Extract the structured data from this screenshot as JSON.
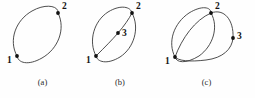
{
  "figure": {
    "background_color": "#fefefe",
    "curve_color": "#3a3a3a",
    "node_color": "#111111",
    "label_color": "#141414",
    "panels": [
      {
        "id": "a",
        "caption": "(a)",
        "description": "single closed elliptical curve with two end nodes",
        "nodes": [
          {
            "label": "1",
            "x": 17,
            "y": 56
          },
          {
            "label": "2",
            "x": 58,
            "y": 13
          }
        ]
      },
      {
        "id": "b",
        "caption": "(b)",
        "description": "closed elliptical curve with interior chord and midside node",
        "nodes": [
          {
            "label": "1",
            "x": 16,
            "y": 56
          },
          {
            "label": "2",
            "x": 52,
            "y": 13
          },
          {
            "label": "3",
            "x": 38,
            "y": 33
          }
        ]
      },
      {
        "id": "c",
        "caption": "(c)",
        "description": "two overlapping elliptical curves sharing two nodes plus a side node",
        "nodes": [
          {
            "label": "1",
            "x": 17,
            "y": 57
          },
          {
            "label": "2",
            "x": 53,
            "y": 13
          },
          {
            "label": "3",
            "x": 75,
            "y": 38
          }
        ]
      }
    ]
  }
}
